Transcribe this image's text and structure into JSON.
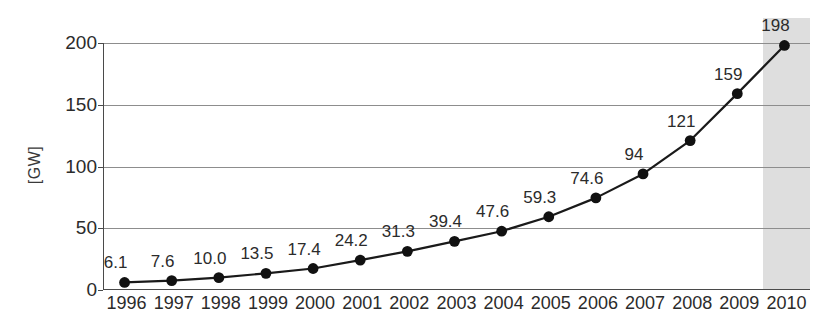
{
  "chart_data": {
    "type": "line",
    "title": "",
    "subtitle": "",
    "xlabel": "",
    "ylabel": "[GW]",
    "categories": [
      "1996",
      "1997",
      "1998",
      "1999",
      "2000",
      "2001",
      "2002",
      "2003",
      "2004",
      "2005",
      "2006",
      "2007",
      "2008",
      "2009",
      "2010"
    ],
    "values": [
      6.1,
      7.6,
      10.0,
      13.5,
      17.4,
      24.2,
      31.3,
      39.4,
      47.6,
      59.3,
      74.6,
      94,
      121,
      159,
      198
    ],
    "point_labels": [
      "6.1",
      "7.6",
      "10.0",
      "13.5",
      "17.4",
      "24.2",
      "31.3",
      "39.4",
      "47.6",
      "59.3",
      "74.6",
      "94",
      "121",
      "159",
      "198"
    ],
    "ylim": [
      0,
      200
    ],
    "y_ticks": [
      0,
      50,
      100,
      150,
      200
    ],
    "y_tick_labels": [
      "0",
      "50",
      "100",
      "150",
      "200"
    ],
    "grid": true,
    "legend": false,
    "legend_position": "none",
    "marker": "filled-circle",
    "series": [
      {
        "name": "Cumulative installed capacity",
        "values": [
          6.1,
          7.6,
          10.0,
          13.5,
          17.4,
          24.2,
          31.3,
          39.4,
          47.6,
          59.3,
          74.6,
          94,
          121,
          159,
          198
        ]
      }
    ],
    "annotations": [
      {
        "type": "highlight-band",
        "category": "2010",
        "label": ""
      }
    ]
  },
  "colors": {
    "line": "#1a1a1a",
    "marker": "#111111",
    "grid": "#8d8d8d",
    "axis": "#4a4a4a",
    "highlight_band": "#d8d8d8",
    "text": "#2b2b2b",
    "background": "#ffffff"
  }
}
